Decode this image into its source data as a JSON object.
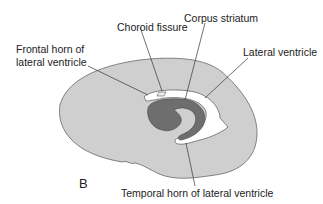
{
  "figure": {
    "panel_label": "B",
    "labels": {
      "choroid_fissure": "Choroid fissure",
      "corpus_striatum": "Corpus striatum",
      "frontal_horn_line1": "Frontal horn of",
      "frontal_horn_line2": "lateral ventricle",
      "lateral_ventricle": "Lateral ventricle",
      "temporal_horn": "Temporal horn of lateral ventricle"
    },
    "colors": {
      "hemisphere_fill": "#cfcfcf",
      "caudate_fill": "#6e6e6e",
      "ventricle_fill": "#ffffff",
      "outline": "#555555",
      "leader_line": "#333333"
    }
  }
}
